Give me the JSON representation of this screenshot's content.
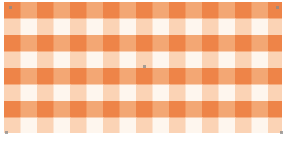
{
  "image": {
    "pattern": "gingham-check",
    "period_px": 33,
    "band_px": 16.5,
    "colors": {
      "dark": "#EE8448",
      "mid": "#F3A774",
      "light": "#FBD3B5",
      "white": "#FEF6EE"
    }
  },
  "selection": {
    "handles": [
      "top-left",
      "top-right",
      "center",
      "bottom-left",
      "bottom-right"
    ],
    "handle_color": "#8a8a8a"
  }
}
